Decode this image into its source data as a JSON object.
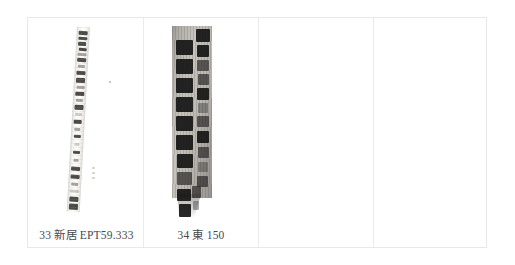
{
  "plate": {
    "name": "bamboo-slip-plate",
    "background_color": "#ffffff",
    "border_color": "#e8e8e8",
    "cell_divider_color": "#ebebeb",
    "columns": 4
  },
  "cells": [
    {
      "index": 1,
      "caption": "33 新居 EPT59.333",
      "number": "33",
      "site": "新居",
      "catalog": "EPT59.333",
      "figure": {
        "name": "bamboo-slip-33",
        "kind": "narrow-pale-bamboo-strip",
        "description": "Tall narrow light bamboo slip with faint vertical column of ink characters, tilted slightly clockwise",
        "ink_color": "#2a2a2a",
        "surface_color": "#f7f6f3"
      }
    },
    {
      "index": 2,
      "caption": "34 東 150",
      "number": "34",
      "site": "東",
      "catalog": "150",
      "figure": {
        "name": "bamboo-slip-34",
        "kind": "dark-wooden-slip",
        "description": "Wide dark wooden slip with two columns of bold brush-written characters and a frayed lower tail",
        "ink_color": "#151515",
        "surface_color": "#a8a49c"
      }
    },
    {
      "index": 3,
      "caption": "",
      "figure": null
    },
    {
      "index": 4,
      "caption": "",
      "figure": null
    }
  ]
}
